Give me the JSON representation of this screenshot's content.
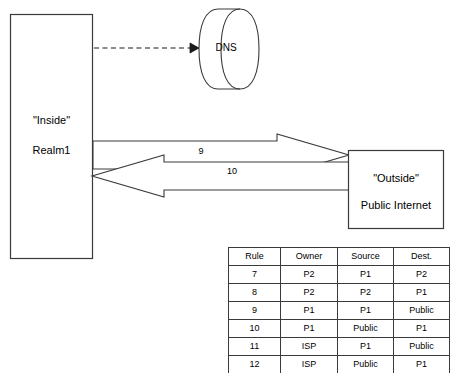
{
  "diagram": {
    "inside_node": {
      "name": "inside-realm-box",
      "line1": "\"Inside\"",
      "line2": "Realm1"
    },
    "dns_node": {
      "name": "dns-cylinder",
      "label": "DNS"
    },
    "outside_node": {
      "name": "outside-internet-box",
      "line1": "\"Outside\"",
      "line2": "Public Internet"
    },
    "flows": [
      {
        "id": "flow-outbound",
        "label": "9",
        "direction": "right",
        "note": "Inside to Outside"
      },
      {
        "id": "flow-inbound",
        "label": "10",
        "direction": "left",
        "note": "Outside to Inside"
      },
      {
        "id": "flow-dns-query",
        "label": "",
        "direction": "right",
        "note": "dashed query to DNS"
      }
    ],
    "colors": {
      "stroke": "#3a3a3a",
      "fill": "#ffffff",
      "text": "#000000"
    }
  },
  "rules_table": {
    "name": "rules-table",
    "headers": [
      "Rule",
      "Owner",
      "Source",
      "Dest."
    ],
    "rows": [
      [
        "7",
        "P2",
        "P1",
        "P2"
      ],
      [
        "8",
        "P2",
        "P2",
        "P1"
      ],
      [
        "9",
        "P1",
        "P1",
        "Public"
      ],
      [
        "10",
        "P1",
        "Public",
        "P1"
      ],
      [
        "11",
        "ISP",
        "P1",
        "Public"
      ],
      [
        "12",
        "ISP",
        "Public",
        "P1"
      ]
    ]
  }
}
